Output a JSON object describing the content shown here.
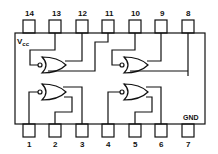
{
  "diagram": {
    "type": "IC pinout",
    "vcc_label": "V",
    "vcc_sub": "cc",
    "gnd_label": "GND",
    "top_pins": [
      "14",
      "13",
      "12",
      "11",
      "10",
      "9",
      "8"
    ],
    "bottom_pins": [
      "1",
      "2",
      "3",
      "4",
      "5",
      "6",
      "7"
    ],
    "gates": [
      "NOR gate 1",
      "NOR gate 2",
      "NOR gate 3",
      "NOR gate 4"
    ]
  }
}
